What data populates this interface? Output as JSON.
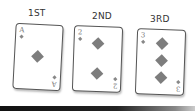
{
  "cards": [
    {
      "label": "1ST",
      "rank": "A",
      "suit": "diamond",
      "pips": 1
    },
    {
      "label": "2ND",
      "rank": "2",
      "suit": "diamond",
      "pips": 2
    },
    {
      "label": "3RD",
      "rank": "3",
      "suit": "diamond",
      "pips": 3
    }
  ],
  "colors": {
    "pip": "#7d7d7d",
    "border": "#555555",
    "bar": "#111111"
  }
}
